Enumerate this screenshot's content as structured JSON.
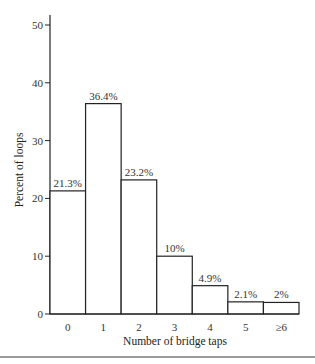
{
  "chart_data": {
    "type": "bar",
    "title": "",
    "xlabel": "Number of bridge taps",
    "ylabel": "Percent of loops",
    "categories": [
      "0",
      "1",
      "2",
      "3",
      "4",
      "5",
      "≥6"
    ],
    "values": [
      21.3,
      36.4,
      23.2,
      10,
      4.9,
      2.1,
      2
    ],
    "value_labels": [
      "21.3%",
      "36.4%",
      "23.2%",
      "10%",
      "4.9%",
      "2.1%",
      "2%"
    ],
    "ylim": [
      0,
      50
    ],
    "yticks": [
      0,
      10,
      20,
      30,
      40,
      50
    ],
    "grid": false,
    "legend": null,
    "bar_fill": "#ffffff",
    "bar_edge": "#222222"
  }
}
